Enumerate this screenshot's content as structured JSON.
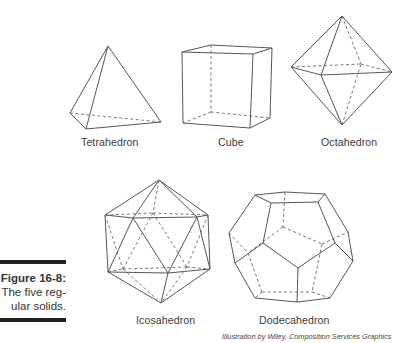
{
  "figure": {
    "caption_number": "Figure 16-8:",
    "caption_lines": [
      "The five reg-",
      "ular solids."
    ],
    "credit": "Illustration by Wiley, Composition Services Graphics"
  },
  "solids": [
    {
      "name": "Tetrahedron"
    },
    {
      "name": "Cube"
    },
    {
      "name": "Octahedron"
    },
    {
      "name": "Icosahedron"
    },
    {
      "name": "Dodecahedron"
    }
  ]
}
